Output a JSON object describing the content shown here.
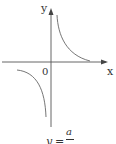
{
  "figure": {
    "type": "hyperbola graph",
    "axes": {
      "x_label": "x",
      "y_label": "y",
      "origin_label": "0"
    },
    "curves": [
      {
        "name": "branch-quadrant-I",
        "description": "decreasing curve in first quadrant approaching both axes"
      },
      {
        "name": "branch-quadrant-III",
        "description": "decreasing curve in third quadrant approaching both axes"
      }
    ],
    "caption": {
      "lhs": "y",
      "equals": "=",
      "numerator": "a",
      "denominator": "x",
      "full": "y = a/x"
    },
    "colors": {
      "line": "#555555",
      "axis": "#444444",
      "text": "#333333",
      "background": "#ffffff"
    }
  }
}
